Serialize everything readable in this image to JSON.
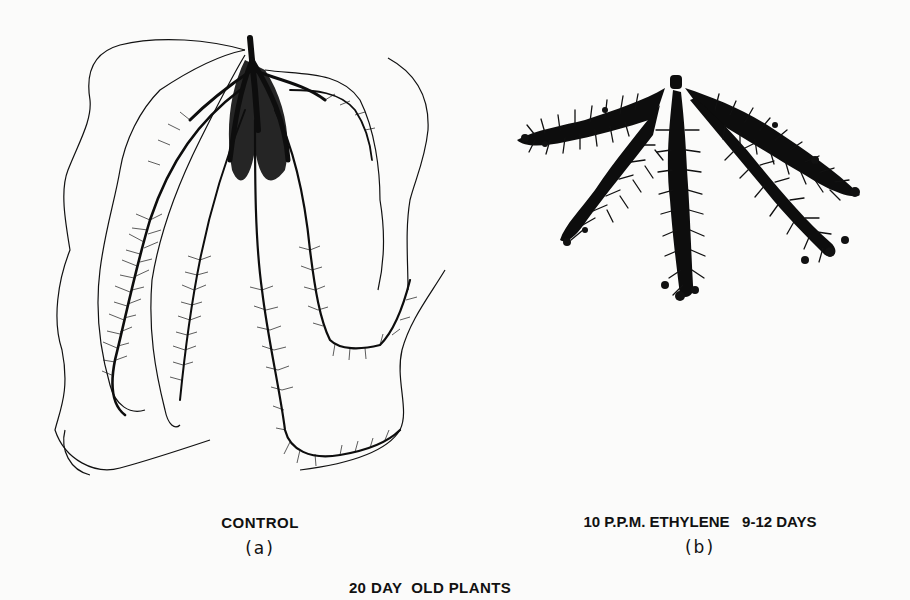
{
  "figure": {
    "title": "20 DAY  OLD PLANTS",
    "panels": [
      {
        "id": "a",
        "caption": "CONTROL",
        "label": "(a)",
        "description": "Root system of control plant: long, elongated lateral roots with fine root hairs, outlined by soil-contour traces"
      },
      {
        "id": "b",
        "caption": "10 P.P.M. ETHYLENE   9-12 DAYS",
        "label": "(b)",
        "description": "Root system of ethylene-treated plant: short, compact, densely branched roots"
      }
    ],
    "colors": {
      "background": "#fbfbfa",
      "ink": "#111111"
    }
  }
}
